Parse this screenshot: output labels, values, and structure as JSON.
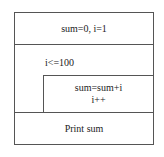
{
  "diagram": {
    "type": "nassi-shneiderman",
    "init": {
      "text": "sum=0, i=1"
    },
    "loop": {
      "condition": "i<=100",
      "body": [
        "sum=sum+i",
        "i++"
      ]
    },
    "output": {
      "text": "Print sum"
    }
  }
}
